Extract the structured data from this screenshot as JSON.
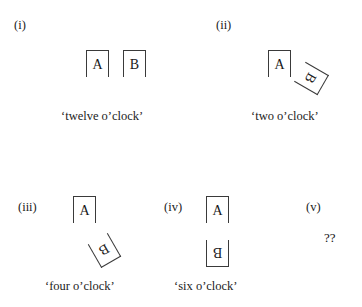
{
  "figure": {
    "kind": "mental-rotation-stimulus-set",
    "background_color": "#ffffff",
    "line_color": "#3a3a3a",
    "text_color": "#1a1a1a",
    "letter_a": "A",
    "letter_b": "B",
    "unknown_marker": "??"
  },
  "panels": [
    {
      "id": "i",
      "label": "(i)",
      "caption": "‘twelve o’clock’",
      "boxes": [
        {
          "letter": "A",
          "rotation_deg": 0
        },
        {
          "letter": "B",
          "rotation_deg": 0
        }
      ]
    },
    {
      "id": "ii",
      "label": "(ii)",
      "caption": "‘two o’clock’",
      "boxes": [
        {
          "letter": "A",
          "rotation_deg": 0
        },
        {
          "letter": "B",
          "rotation_deg": 120
        }
      ]
    },
    {
      "id": "iii",
      "label": "(iii)",
      "caption": "‘four o’clock’",
      "boxes": [
        {
          "letter": "A",
          "rotation_deg": 0
        },
        {
          "letter": "B",
          "rotation_deg": 150
        }
      ]
    },
    {
      "id": "iv",
      "label": "(iv)",
      "caption": "‘six o’clock’",
      "boxes": [
        {
          "letter": "A",
          "rotation_deg": 0
        },
        {
          "letter": "B",
          "rotation_deg": 180
        }
      ]
    },
    {
      "id": "v",
      "label": "(v)",
      "caption": "",
      "marker": "??",
      "boxes": []
    }
  ]
}
